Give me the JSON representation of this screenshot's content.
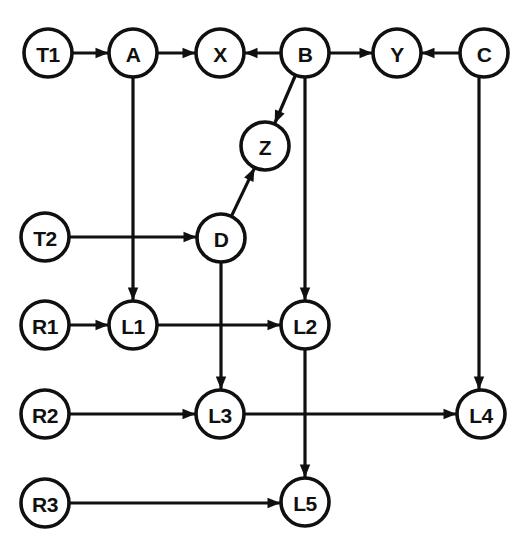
{
  "diagram": {
    "width": 532,
    "height": 546,
    "background_color": "#ffffff",
    "stroke_color": "#101010",
    "node_fill_color": "#ffffff",
    "node_radius": 24,
    "nodes": [
      {
        "id": "T1",
        "label": "T1",
        "x": 48,
        "y": 53
      },
      {
        "id": "A",
        "label": "A",
        "x": 133,
        "y": 53
      },
      {
        "id": "X",
        "label": "X",
        "x": 220,
        "y": 53
      },
      {
        "id": "B",
        "label": "B",
        "x": 305,
        "y": 53
      },
      {
        "id": "Y",
        "label": "Y",
        "x": 397,
        "y": 53
      },
      {
        "id": "C",
        "label": "C",
        "x": 484,
        "y": 53
      },
      {
        "id": "Z",
        "label": "Z",
        "x": 265,
        "y": 146
      },
      {
        "id": "T2",
        "label": "T2",
        "x": 45,
        "y": 237
      },
      {
        "id": "D",
        "label": "D",
        "x": 221,
        "y": 238
      },
      {
        "id": "R1",
        "label": "R1",
        "x": 45,
        "y": 325
      },
      {
        "id": "L1",
        "label": "L1",
        "x": 133,
        "y": 325
      },
      {
        "id": "L2",
        "label": "L2",
        "x": 305,
        "y": 325
      },
      {
        "id": "R2",
        "label": "R2",
        "x": 45,
        "y": 414
      },
      {
        "id": "L3",
        "label": "L3",
        "x": 220,
        "y": 414
      },
      {
        "id": "L4",
        "label": "L4",
        "x": 481,
        "y": 414
      },
      {
        "id": "R3",
        "label": "R3",
        "x": 45,
        "y": 503
      },
      {
        "id": "L5",
        "label": "L5",
        "x": 305,
        "y": 502
      }
    ],
    "edges": [
      {
        "id": "e-t1-a",
        "from": "T1",
        "to": "A",
        "kind": "horizontal"
      },
      {
        "id": "e-a-x",
        "from": "A",
        "to": "X",
        "kind": "horizontal"
      },
      {
        "id": "e-b-x",
        "from": "B",
        "to": "X",
        "kind": "horizontal"
      },
      {
        "id": "e-b-y",
        "from": "B",
        "to": "Y",
        "kind": "horizontal"
      },
      {
        "id": "e-c-y",
        "from": "C",
        "to": "Y",
        "kind": "horizontal"
      },
      {
        "id": "e-b-z",
        "from": "B",
        "to": "Z",
        "kind": "diagonal"
      },
      {
        "id": "e-d-z",
        "from": "D",
        "to": "Z",
        "kind": "diagonal"
      },
      {
        "id": "e-a-l1",
        "from": "A",
        "to": "L1",
        "kind": "vertical"
      },
      {
        "id": "e-t2-d",
        "from": "T2",
        "to": "D",
        "kind": "horizontal"
      },
      {
        "id": "e-r1-l1",
        "from": "R1",
        "to": "L1",
        "kind": "horizontal"
      },
      {
        "id": "e-l1-l2",
        "from": "L1",
        "to": "L2",
        "kind": "horizontal"
      },
      {
        "id": "e-b-l2",
        "from": "B",
        "to": "L2",
        "kind": "vertical"
      },
      {
        "id": "e-d-l3",
        "from": "D",
        "to": "L3",
        "kind": "vertical"
      },
      {
        "id": "e-r2-l3",
        "from": "R2",
        "to": "L3",
        "kind": "horizontal"
      },
      {
        "id": "e-l3-l4",
        "from": "L3",
        "to": "L4",
        "kind": "horizontal"
      },
      {
        "id": "e-c-l4",
        "from": "C",
        "to": "L4",
        "kind": "vertical"
      },
      {
        "id": "e-l2-l5",
        "from": "L2",
        "to": "L5",
        "kind": "vertical"
      },
      {
        "id": "e-r3-l5",
        "from": "R3",
        "to": "L5",
        "kind": "horizontal"
      }
    ]
  }
}
